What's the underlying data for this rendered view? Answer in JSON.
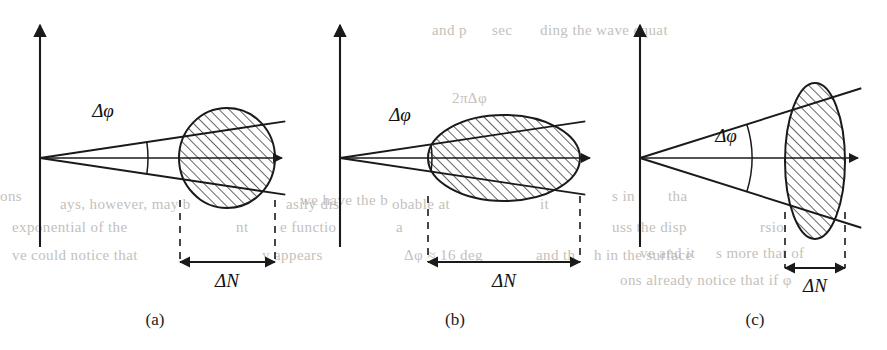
{
  "figure": {
    "background_color": "#ffffff",
    "ink_color": "#1a1a1a",
    "bleed_color": "#b9b6b0",
    "hatch_angle_deg": 45,
    "hatch_spacing_px": 7
  },
  "labels": {
    "delta_phi": "Δφ",
    "delta_n": "ΔN"
  },
  "panels": [
    {
      "id": "a",
      "caption": "(a)",
      "caption_x": 155,
      "caption_y": 325,
      "origin_x": 40,
      "origin_y": 158,
      "axis_top_y": 25,
      "axis_bottom_y": 247,
      "axis_right_x": 282,
      "cone_half_angle_deg": 8.5,
      "cone_length": 248,
      "arc_radius": 108,
      "region_shape": "circle",
      "region_cx": 227,
      "region_cy": 158,
      "region_rx": 48,
      "region_ry": 50,
      "region_rotation_deg": 0,
      "dn_left_x": 180,
      "dn_right_x": 275,
      "dn_bracket_top_y": 200,
      "dn_arrow_y": 262,
      "phi_label_x": 103,
      "phi_label_y": 117,
      "dn_label_x": 227,
      "dn_label_y": 287
    },
    {
      "id": "b",
      "caption": "(b)",
      "caption_x": 455,
      "caption_y": 325,
      "origin_x": 340,
      "origin_y": 158,
      "axis_top_y": 25,
      "axis_bottom_y": 247,
      "axis_right_x": 590,
      "cone_half_angle_deg": 8.5,
      "cone_length": 248,
      "arc_radius": 92,
      "region_shape": "ellipse",
      "region_cx": 504,
      "region_cy": 158,
      "region_rx": 76,
      "region_ry": 43,
      "region_rotation_deg": 0,
      "dn_left_x": 428,
      "dn_right_x": 580,
      "dn_bracket_top_y": 196,
      "dn_arrow_y": 262,
      "phi_label_x": 400,
      "phi_label_y": 121,
      "dn_label_x": 504,
      "dn_label_y": 287
    },
    {
      "id": "c",
      "caption": "(c)",
      "caption_x": 755,
      "caption_y": 325,
      "origin_x": 640,
      "origin_y": 158,
      "axis_top_y": 25,
      "axis_bottom_y": 247,
      "axis_right_x": 858,
      "cone_half_angle_deg": 17.5,
      "cone_length": 232,
      "arc_radius": 112,
      "region_shape": "ellipse",
      "region_cx": 815,
      "region_cy": 161,
      "region_rx": 30,
      "region_ry": 78,
      "region_rotation_deg": 0,
      "dn_left_x": 785,
      "dn_right_x": 845,
      "dn_bracket_top_y": 212,
      "dn_arrow_y": 268,
      "phi_label_x": 726,
      "phi_label_y": 142,
      "dn_label_x": 815,
      "dn_label_y": 292
    }
  ],
  "bleed_text": [
    {
      "text": "and p",
      "x": 432,
      "y": 22
    },
    {
      "text": "sec",
      "x": 492,
      "y": 22
    },
    {
      "text": "ding the wave equat",
      "x": 540,
      "y": 22
    },
    {
      "text": "2πΔφ",
      "x": 452,
      "y": 90
    },
    {
      "text": "ons",
      "x": 0,
      "y": 188
    },
    {
      "text": "s in",
      "x": 612,
      "y": 188
    },
    {
      "text": "tha",
      "x": 668,
      "y": 188
    },
    {
      "text": "we have the b",
      "x": 300,
      "y": 192
    },
    {
      "text": "ays, however, may b",
      "x": 60,
      "y": 196
    },
    {
      "text": "asily dis",
      "x": 286,
      "y": 196
    },
    {
      "text": "obable at",
      "x": 392,
      "y": 196
    },
    {
      "text": "it",
      "x": 540,
      "y": 196
    },
    {
      "text": "exponential of the",
      "x": 12,
      "y": 219
    },
    {
      "text": "nt",
      "x": 236,
      "y": 219
    },
    {
      "text": "e functio",
      "x": 280,
      "y": 219
    },
    {
      "text": "a",
      "x": 396,
      "y": 219
    },
    {
      "text": "uss the disp",
      "x": 612,
      "y": 219
    },
    {
      "text": "rsio",
      "x": 760,
      "y": 219
    },
    {
      "text": "ve and it",
      "x": 640,
      "y": 245
    },
    {
      "text": "s more that of",
      "x": 716,
      "y": 245
    },
    {
      "text": "ve could notice that",
      "x": 12,
      "y": 247
    },
    {
      "text": "y appears",
      "x": 262,
      "y": 247
    },
    {
      "text": "Δφ ≈ 16 deg",
      "x": 404,
      "y": 247
    },
    {
      "text": "and th",
      "x": 536,
      "y": 247
    },
    {
      "text": "h in the surface",
      "x": 594,
      "y": 247
    },
    {
      "text": "ons already notice that if φ",
      "x": 620,
      "y": 272
    }
  ]
}
